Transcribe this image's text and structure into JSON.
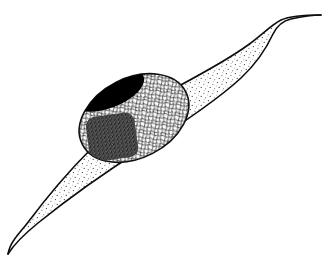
{
  "figure": {
    "kind": "scientific-line-drawing",
    "background_color": "#ffffff",
    "ink_color": "#0d0d0d",
    "canvas": {
      "width": 326,
      "height": 269
    },
    "caption": "",
    "labels": [],
    "annotations": []
  },
  "cell": {
    "name": "cell-body",
    "description": "spindle-shaped fusiform cell with two tapering processes",
    "outline_color": "#111111",
    "outline_width": 1.6,
    "fill_color": "#ffffff",
    "texture": "fine-stipple",
    "texture_dot_color": "#3b3b3b",
    "texture_density": "sparse",
    "upper_tip": {
      "x": 316,
      "y": 16
    },
    "lower_tip": {
      "x": 8,
      "y": 254
    },
    "long_axis_angle_deg": -41
  },
  "nucleus": {
    "name": "nucleus",
    "shape": "ellipse",
    "center": {
      "x": 134,
      "y": 118
    },
    "radius_x": 58,
    "radius_y": 40,
    "rotation_deg": -27,
    "outline_color": "#111111",
    "outline_width": 1.6,
    "fill_color": "#fbfbfb",
    "texture": "reticular-chromatin-network",
    "texture_color": "#2e2e2e"
  },
  "dark_body": {
    "name": "dense-chromatin-mass",
    "shape": "ellipse",
    "center": {
      "x": 108,
      "y": 90
    },
    "radius_x": 38,
    "radius_y": 18,
    "rotation_deg": -21,
    "fill_color": "#000000",
    "tone": "solid black"
  },
  "nucleolus": {
    "name": "nucleolus",
    "shape": "rounded-square",
    "center": {
      "x": 112,
      "y": 137
    },
    "half_width": 24,
    "half_height": 22,
    "corner_radius": 9,
    "rotation_deg": -8,
    "fill_color": "#4a4a4a",
    "texture": "dense-stipple",
    "tone": "dark grey stipple"
  },
  "palette": {
    "paper": "#ffffff",
    "line": "#111111",
    "solid_black": "#000000",
    "mid_grey": "#4a4a4a",
    "light_stipple": "#3b3b3b"
  }
}
